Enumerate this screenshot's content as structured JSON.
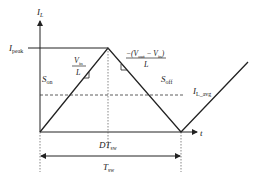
{
  "labels": {
    "y_axis": "I",
    "y_axis_sub": "L",
    "x_axis": "t",
    "ipeak": "I",
    "ipeak_sub": "peak",
    "s_on": "S",
    "s_on_sub": "on",
    "s_off": "S",
    "s_off_sub": "off",
    "on_slope_num": "V",
    "on_slope_num_sub": "in",
    "on_slope_den": "L",
    "off_slope_num_prefix": "−(V",
    "off_slope_num_sub1": "out",
    "off_slope_num_mid": " − V",
    "off_slope_num_sub2": "in",
    "off_slope_num_suffix": ")",
    "off_slope_den": "L",
    "i_avg": "I",
    "i_avg_sub": "L_avg",
    "d_tsw": "DT",
    "d_tsw_sub": "sw",
    "tsw": "T",
    "tsw_sub": "sw"
  },
  "colors": {
    "line": "#222222",
    "dashed": "#333333"
  }
}
